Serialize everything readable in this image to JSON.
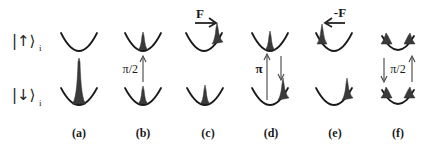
{
  "states": {
    "up": {
      "label": "|↑⟩",
      "subscript": "i"
    },
    "down": {
      "label": "|↓⟩",
      "subscript": "i"
    }
  },
  "panels": [
    {
      "id": "a",
      "label": "(a)",
      "upper": "empty",
      "lower": "tall-center-peak"
    },
    {
      "id": "b",
      "label": "(b)",
      "pulse_label": "π/2",
      "pulse_direction": "up",
      "upper": "center-peak",
      "lower": "center-peak"
    },
    {
      "id": "c",
      "label": "(c)",
      "force_label": "F",
      "force_direction": "right",
      "upper": "right-peak",
      "lower": "center-peak"
    },
    {
      "id": "d",
      "label": "(d)",
      "pulse_label": "π",
      "pulse_direction": "up-and-down",
      "upper": "center-peak",
      "lower": "right-peak"
    },
    {
      "id": "e",
      "label": "(e)",
      "force_label": "-F",
      "force_direction": "left",
      "upper": "left-peak",
      "lower": "right-peak"
    },
    {
      "id": "f",
      "label": "(f)",
      "pulse_label": "π/2",
      "pulse_direction": "down-and-up",
      "upper": "left-and-right-peaks",
      "lower": "left-and-right-peaks"
    }
  ],
  "colors": {
    "curve": "#1a1a1a",
    "peak": "#3a3a3a",
    "arrow": "#444444",
    "background": "#ffffff"
  }
}
